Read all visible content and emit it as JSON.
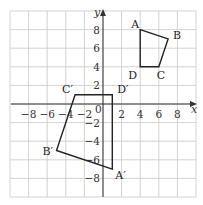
{
  "diagram": {
    "type": "coordinate-grid-transformation",
    "axes": {
      "x_label": "x",
      "y_label": "y",
      "origin_label": "0",
      "x_range": [
        -10,
        10
      ],
      "y_range": [
        -10,
        10
      ],
      "grid_step": 2,
      "x_ticks": [
        -8,
        -6,
        -4,
        -2,
        2,
        4,
        6,
        8
      ],
      "y_ticks": [
        8,
        6,
        4,
        2,
        -2,
        -4,
        -6,
        -8
      ]
    },
    "shapes": [
      {
        "name": "ABCD",
        "vertices": [
          {
            "label": "A",
            "x": 4,
            "y": 8
          },
          {
            "label": "B",
            "x": 7,
            "y": 7
          },
          {
            "label": "C",
            "x": 6,
            "y": 4
          },
          {
            "label": "D",
            "x": 4,
            "y": 4
          }
        ]
      },
      {
        "name": "A'B'C'D'",
        "vertices": [
          {
            "label": "A′",
            "x": 1,
            "y": -7
          },
          {
            "label": "B′",
            "x": -5,
            "y": -5
          },
          {
            "label": "C′",
            "x": -3,
            "y": 1
          },
          {
            "label": "D′",
            "x": 1,
            "y": 1
          }
        ]
      }
    ],
    "colors": {
      "grid": "#c8c8c8",
      "axis": "#333333",
      "shape": "#222222"
    }
  }
}
